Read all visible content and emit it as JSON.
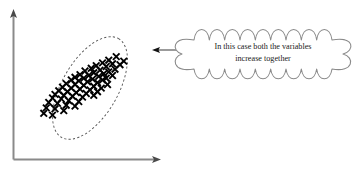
{
  "figure": {
    "background_color": "#ffffff"
  },
  "axes": {
    "color": "#8a8a8a",
    "x_axis_label": "",
    "y_axis_label": "",
    "x_arrow_icon": "arrow-right-icon",
    "y_arrow_icon": "arrow-up-icon"
  },
  "callout": {
    "shape": "cloud",
    "text_line_1": "In this case both the variables",
    "text_line_2": "increase together",
    "outline_color": "#8a8a8a",
    "fill_color": "#ffffff",
    "pointer_icon": "arrow-left-icon"
  },
  "cluster": {
    "boundary_shape": "dashed-ellipse",
    "boundary_color": "#4a4a4a",
    "marker_symbol": "×",
    "marker_color": "#000000",
    "marker_count": 61
  },
  "chart_data": {
    "type": "scatter",
    "title": "",
    "xlabel": "",
    "ylabel": "",
    "annotation": "In this case both the variables increase together",
    "correlation": "positive",
    "grid": false,
    "legend": false,
    "xlim": [
      0,
      100
    ],
    "ylim": [
      0,
      100
    ],
    "points": [
      [
        69,
        86
      ],
      [
        63,
        82
      ],
      [
        75,
        81
      ],
      [
        58,
        79
      ],
      [
        66,
        78
      ],
      [
        72,
        77
      ],
      [
        53,
        76
      ],
      [
        61,
        75
      ],
      [
        49,
        73
      ],
      [
        68,
        72
      ],
      [
        56,
        71
      ],
      [
        44,
        70
      ],
      [
        63,
        69
      ],
      [
        51,
        68
      ],
      [
        59,
        67
      ],
      [
        40,
        66
      ],
      [
        47,
        65
      ],
      [
        66,
        65
      ],
      [
        55,
        64
      ],
      [
        36,
        63
      ],
      [
        43,
        62
      ],
      [
        61,
        62
      ],
      [
        50,
        61
      ],
      [
        33,
        60
      ],
      [
        58,
        60
      ],
      [
        39,
        59
      ],
      [
        46,
        58
      ],
      [
        54,
        57
      ],
      [
        29,
        56
      ],
      [
        36,
        55
      ],
      [
        62,
        55
      ],
      [
        43,
        54
      ],
      [
        51,
        53
      ],
      [
        26,
        52
      ],
      [
        33,
        51
      ],
      [
        57,
        51
      ],
      [
        40,
        50
      ],
      [
        48,
        49
      ],
      [
        23,
        48
      ],
      [
        30,
        47
      ],
      [
        54,
        47
      ],
      [
        37,
        46
      ],
      [
        45,
        45
      ],
      [
        20,
        44
      ],
      [
        27,
        43
      ],
      [
        51,
        43
      ],
      [
        34,
        42
      ],
      [
        42,
        41
      ],
      [
        18,
        40
      ],
      [
        25,
        39
      ],
      [
        31,
        37
      ],
      [
        39,
        36
      ],
      [
        15,
        35
      ],
      [
        22,
        34
      ],
      [
        29,
        32
      ],
      [
        36,
        31
      ],
      [
        13,
        29
      ],
      [
        20,
        28
      ],
      [
        27,
        26
      ],
      [
        11,
        23
      ],
      [
        18,
        21
      ]
    ]
  }
}
